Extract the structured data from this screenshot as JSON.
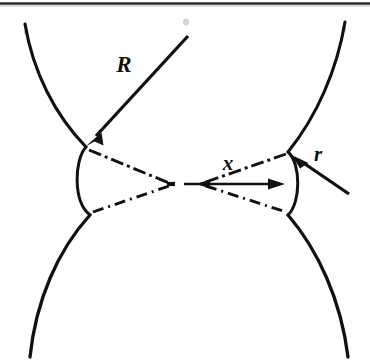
{
  "figure": {
    "background_color": "#ffffff",
    "ink_color": "#111111",
    "width": 370,
    "height": 360
  },
  "labels": {
    "sphere_radius": {
      "text": "R",
      "x": 124,
      "y": 72,
      "font_size": 23
    },
    "meniscus_radius": {
      "text": "r",
      "x": 318,
      "y": 161,
      "font_size": 21
    },
    "bridge_half_width": {
      "text": "x",
      "x": 228,
      "y": 170,
      "font_size": 21
    }
  },
  "geometry": {
    "upper_left_sphere": "M 25,24 C 33,72 55,115 86,147",
    "lower_left_sphere": "M 90,215 C 58,250 36,300 30,357",
    "upper_right_sphere": "M 345,22 C 337,70 317,116 288,152",
    "lower_right_sphere": "M 288,215 C 318,250 341,300 348,357",
    "left_neck_arc": "M 86,147 C 74,160 74,202 90,215",
    "right_neck_arc": "M 288,152 C 300,163 300,203 288,215",
    "meniscus_upper_left": "M 88,150 L 170,183",
    "meniscus_lower_left": "M 92,213 L 170,185",
    "meniscus_upper_right": "M 205,183 L 287,154",
    "meniscus_lower_right": "M 205,185 L 287,213",
    "dimension_line_x": {
      "x1": 182,
      "y1": 184,
      "x2": 280,
      "y2": 184
    },
    "leader_R": {
      "x1": 186,
      "y1": 38,
      "x2": 92,
      "y2": 140
    },
    "leader_r": {
      "x1": 348,
      "y1": 193,
      "x2": 293,
      "y2": 156
    },
    "tick_dash": {
      "x1": 167,
      "y1": 184,
      "x2": 175,
      "y2": 184
    },
    "scan_edge_top": {
      "x1": 0,
      "y1": 4,
      "x2": 370,
      "y2": 4
    }
  },
  "dash_patterns": {
    "meniscus": "13 4 3 4",
    "meniscus_alt": "11 5 2 5"
  },
  "stroke_widths": {
    "sphere": 3.1,
    "neck": 3.0,
    "meniscus": 2.8,
    "leader": 3.2,
    "dimension": 2.6,
    "scan_edge": 2.2
  }
}
